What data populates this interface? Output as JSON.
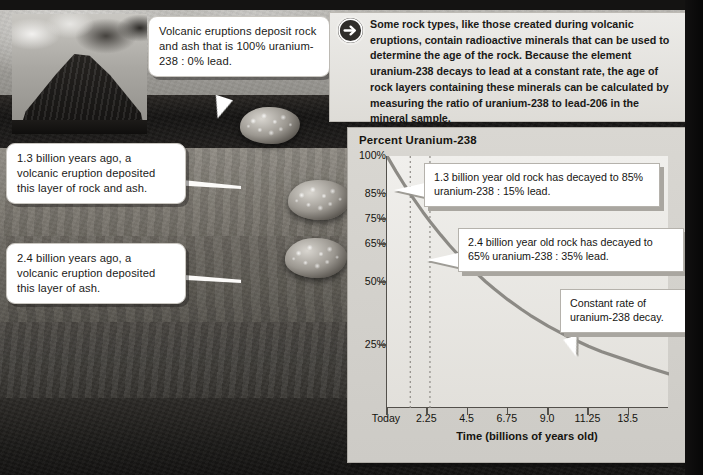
{
  "intro": {
    "icon": "arrow-right-circle-icon",
    "text": "Some rock types, like those created during volcanic eruptions, contain radioactive minerals that can be used to determine the age of the rock. Because the element uranium-238 decays to lead at a constant rate, the age of rock layers containing these minerals can be calculated by measuring the ratio of uranium-238 to lead-206 in the mineral sample."
  },
  "callouts": {
    "volcano": "Volcanic eruptions deposit rock and ash that is 100% uranium-238 : 0% lead.",
    "layer_13": "1.3 billion years ago, a volcanic eruption deposited this layer of rock and ash.",
    "layer_24": "2.4 billion years ago, a volcanic eruption deposited this layer of ash."
  },
  "chart_data": {
    "type": "line",
    "title": "Percent Uranium-238",
    "xlabel": "Time (billions of years old)",
    "ylabel": "Percent Uranium-238",
    "xlim": [
      0,
      15.75
    ],
    "ylim": [
      0,
      100
    ],
    "grid": false,
    "legend": "none",
    "x_tick_labels": [
      "Today",
      "2.25",
      "4.5",
      "6.75",
      "9.0",
      "11.25",
      "13.5"
    ],
    "x_tick_values": [
      0,
      2.25,
      4.5,
      6.75,
      9.0,
      11.25,
      13.5
    ],
    "y_tick_labels": [
      "100%",
      "85%",
      "75%",
      "65%",
      "50%",
      "25%"
    ],
    "y_tick_values": [
      100,
      85,
      75,
      65,
      50,
      25
    ],
    "series": [
      {
        "name": "Percent uranium-238 remaining",
        "x": [
          0,
          0.5,
          1.0,
          1.3,
          1.5,
          2.0,
          2.4,
          2.5,
          3.0,
          3.5,
          4.0,
          4.5,
          5.0,
          5.5,
          6.0,
          6.75,
          7.5,
          8.0,
          9.0,
          10.0,
          11.25,
          12.0,
          13.5,
          14.5,
          15.75
        ],
        "y": [
          100,
          93.9,
          88.2,
          85.0,
          82.9,
          77.8,
          74.0,
          73.1,
          68.7,
          64.5,
          60.6,
          56.9,
          53.5,
          50.2,
          47.2,
          43.0,
          39.2,
          36.8,
          32.5,
          28.7,
          24.5,
          22.3,
          18.7,
          16.3,
          13.5
        ]
      }
    ],
    "annotations": [
      {
        "id": "point-13",
        "x": 1.3,
        "y": 85,
        "label": "1.3 billion year old rock has decayed to 85% uranium-238 : 15% lead."
      },
      {
        "id": "point-24",
        "x": 2.4,
        "y": 65,
        "label": "2.4 billion year old rock has decayed to 65% uranium-238 : 35% lead."
      },
      {
        "id": "decay-rate",
        "x": 8.2,
        "y": 36,
        "label": "Constant rate of uranium-238 decay."
      }
    ],
    "guide_lines": [
      {
        "x": 1.3,
        "style": "dotted"
      },
      {
        "x": 2.4,
        "style": "dotted"
      }
    ],
    "colors": {
      "curve": "#8c8a85",
      "axis": "#53504b",
      "plot_bg": "#eeedea",
      "panel_bg": "#d5d3ce",
      "callout_bg": "#ffffff"
    }
  }
}
